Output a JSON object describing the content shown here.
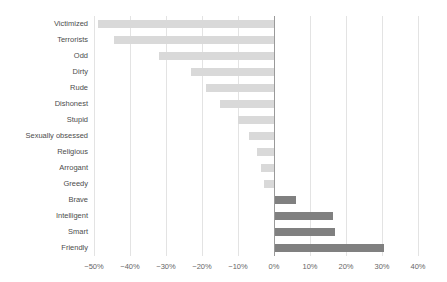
{
  "chart_data": {
    "type": "bar",
    "orientation": "horizontal",
    "title": "",
    "xlabel": "",
    "ylabel": "",
    "xlim": [
      -50,
      40
    ],
    "xticks": [
      -50,
      -40,
      -30,
      -20,
      -10,
      0,
      10,
      20,
      30,
      40
    ],
    "xtick_labels": [
      "−50%",
      "−40%",
      "−30%",
      "−20%",
      "−10%",
      "0%",
      "10%",
      "20%",
      "30%",
      "40%"
    ],
    "grid": true,
    "legend": "none",
    "categories": [
      "Victimized",
      "Terrorists",
      "Odd",
      "Dirty",
      "Rude",
      "Dishonest",
      "Stupid",
      "Sexually obsessed",
      "Religious",
      "Arrogant",
      "Greedy",
      "Brave",
      "Intelligent",
      "Smart",
      "Friendly"
    ],
    "values": [
      -49.0,
      -44.5,
      -32.0,
      -23.0,
      -19.0,
      -15.0,
      -10.0,
      -7.0,
      -4.7,
      -3.6,
      -2.8,
      6.0,
      16.5,
      17.0,
      30.5
    ],
    "colors": {
      "negative": "#d9d9d9",
      "positive": "#808080",
      "gridline": "#e3e3e3",
      "zero_axis": "#9a9a9a",
      "label_text": "#4d4d4d",
      "tick_text": "#666666"
    }
  }
}
